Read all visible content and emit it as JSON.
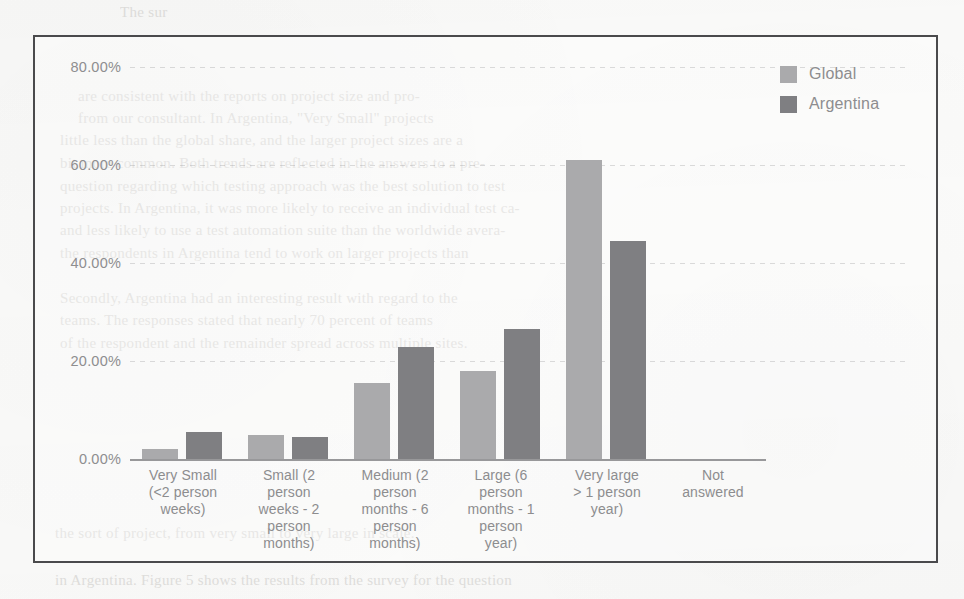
{
  "chart_data": {
    "type": "bar",
    "title": "",
    "xlabel": "",
    "ylabel": "",
    "ylim": [
      0,
      80
    ],
    "grid": true,
    "legend_position": "top-right",
    "ytick_labels": [
      "80.00%",
      "60.00%",
      "40.00%",
      "20.00%",
      "0.00%"
    ],
    "ytick_values": [
      80,
      60,
      40,
      20,
      0
    ],
    "categories": [
      "Very Small (<2 person weeks)",
      "Small (2 person weeks - 2 person months)",
      "Medium (2 person months - 6 person months)",
      "Large (6 person months - 1 person year)",
      "Very large > 1 person year)",
      "Not answered"
    ],
    "category_lines": [
      [
        "Very Small",
        "(<2 person",
        "weeks)"
      ],
      [
        "Small (2",
        "person",
        "weeks - 2",
        "person",
        "months)"
      ],
      [
        "Medium (2",
        "person",
        "months - 6",
        "person",
        "months)"
      ],
      [
        "Large (6",
        "person",
        "months - 1",
        "person",
        "year)"
      ],
      [
        "Very large",
        "> 1 person",
        "year)"
      ],
      [
        "Not",
        "answered"
      ]
    ],
    "series": [
      {
        "name": "Global",
        "color": "#aaaaac",
        "values": [
          2.0,
          5.0,
          15.5,
          18.0,
          61.0,
          0.0
        ]
      },
      {
        "name": "Argentina",
        "color": "#7f7f82",
        "values": [
          5.5,
          4.5,
          22.8,
          26.5,
          44.5,
          0.0
        ]
      }
    ]
  },
  "legend": {
    "items": [
      {
        "label": "Global",
        "swatch_color": "#aaaaac"
      },
      {
        "label": "Argentina",
        "swatch_color": "#7f7f82"
      }
    ]
  },
  "background_text": {
    "lines": [
      "are consistent with the reports on project size and pro-",
      "from our consultant. In Argentina, \"Very Small\" projects",
      "little less than the global share, and the larger project sizes are a",
      "bit more common. Both trends are reflected in the answers to a pre-",
      "question regarding which testing approach was the best solution to test",
      "projects. In Argentina, it was more likely to receive an individual test ca-",
      "and less likely to use a test automation suite than the worldwide avera-",
      "the respondents in Argentina tend to work on larger projects than",
      "Secondly, Argentina had an interesting result with regard to the",
      "teams. The responses stated that nearly 70 percent of teams",
      "of the respondent and the remainder spread across multiple sites."
    ],
    "footer_lines": [
      "the sort of project, from very small to very large in scale.",
      "in Argentina. Figure 5 shows the results from the survey for the question"
    ],
    "top_fragment": "The sur"
  }
}
